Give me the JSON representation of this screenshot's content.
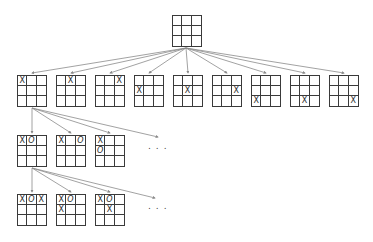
{
  "diagram": {
    "colors": {
      "line": "#3a3a3a",
      "edge": "#8a8a8a",
      "mark": "#2a2a2a"
    },
    "ellipsis": "...",
    "levels": [
      {
        "level": 0,
        "boards": [
          {
            "id": "root",
            "x": 172,
            "y": 15,
            "cells": [
              "",
              "",
              "",
              "",
              "",
              "",
              "",
              "",
              ""
            ]
          }
        ]
      },
      {
        "level": 1,
        "boards": [
          {
            "id": "b1-1",
            "x": 17,
            "y": 75,
            "cells": [
              "X",
              "",
              "",
              "",
              "",
              "",
              "",
              "",
              ""
            ]
          },
          {
            "id": "b1-2",
            "x": 56,
            "y": 75,
            "cells": [
              "",
              "X",
              "",
              "",
              "",
              "",
              "",
              "",
              ""
            ]
          },
          {
            "id": "b1-3",
            "x": 95,
            "y": 75,
            "cells": [
              "",
              "",
              "X",
              "",
              "",
              "",
              "",
              "",
              ""
            ]
          },
          {
            "id": "b1-4",
            "x": 134,
            "y": 75,
            "cells": [
              "",
              "",
              "",
              "X",
              "",
              "",
              "",
              "",
              ""
            ]
          },
          {
            "id": "b1-5",
            "x": 173,
            "y": 75,
            "cells": [
              "",
              "",
              "",
              "",
              "X",
              "",
              "",
              "",
              ""
            ]
          },
          {
            "id": "b1-6",
            "x": 212,
            "y": 75,
            "cells": [
              "",
              "",
              "",
              "",
              "",
              "X",
              "",
              "",
              ""
            ]
          },
          {
            "id": "b1-7",
            "x": 251,
            "y": 75,
            "cells": [
              "",
              "",
              "",
              "",
              "",
              "",
              "X",
              "",
              ""
            ]
          },
          {
            "id": "b1-8",
            "x": 290,
            "y": 75,
            "cells": [
              "",
              "",
              "",
              "",
              "",
              "",
              "",
              "X",
              ""
            ]
          },
          {
            "id": "b1-9",
            "x": 329,
            "y": 75,
            "cells": [
              "",
              "",
              "",
              "",
              "",
              "",
              "",
              "",
              "X"
            ]
          }
        ]
      },
      {
        "level": 2,
        "boards": [
          {
            "id": "b2-1",
            "x": 17,
            "y": 135,
            "cells": [
              "X",
              "O",
              "",
              "",
              "",
              "",
              "",
              "",
              ""
            ]
          },
          {
            "id": "b2-2",
            "x": 56,
            "y": 135,
            "cells": [
              "X",
              "",
              "O",
              "",
              "",
              "",
              "",
              "",
              ""
            ]
          },
          {
            "id": "b2-3",
            "x": 95,
            "y": 135,
            "cells": [
              "X",
              "",
              "",
              "O",
              "",
              "",
              "",
              "",
              ""
            ]
          }
        ],
        "ellipsis_pos": {
          "x": 148,
          "y": 141
        }
      },
      {
        "level": 3,
        "boards": [
          {
            "id": "b3-1",
            "x": 17,
            "y": 194,
            "cells": [
              "X",
              "O",
              "X",
              "",
              "",
              "",
              "",
              "",
              ""
            ]
          },
          {
            "id": "b3-2",
            "x": 56,
            "y": 194,
            "cells": [
              "X",
              "O",
              "",
              "X",
              "",
              "",
              "",
              "",
              ""
            ]
          },
          {
            "id": "b3-3",
            "x": 95,
            "y": 194,
            "cells": [
              "X",
              "O",
              "",
              "",
              "X",
              "",
              "",
              "",
              ""
            ]
          }
        ],
        "ellipsis_pos": {
          "x": 148,
          "y": 201
        }
      }
    ],
    "edges": [
      {
        "from": [
          186,
          48
        ],
        "to": [
          32,
          73
        ]
      },
      {
        "from": [
          186,
          48
        ],
        "to": [
          71,
          73
        ]
      },
      {
        "from": [
          186,
          48
        ],
        "to": [
          110,
          73
        ]
      },
      {
        "from": [
          186,
          48
        ],
        "to": [
          149,
          73
        ]
      },
      {
        "from": [
          186,
          48
        ],
        "to": [
          188,
          73
        ]
      },
      {
        "from": [
          186,
          48
        ],
        "to": [
          227,
          73
        ]
      },
      {
        "from": [
          186,
          48
        ],
        "to": [
          266,
          73
        ]
      },
      {
        "from": [
          186,
          48
        ],
        "to": [
          305,
          73
        ]
      },
      {
        "from": [
          186,
          48
        ],
        "to": [
          344,
          73
        ]
      },
      {
        "from": [
          32,
          108
        ],
        "to": [
          32,
          133
        ]
      },
      {
        "from": [
          32,
          108
        ],
        "to": [
          71,
          133
        ]
      },
      {
        "from": [
          32,
          108
        ],
        "to": [
          110,
          133
        ]
      },
      {
        "from": [
          32,
          108
        ],
        "to": [
          158,
          137
        ]
      },
      {
        "from": [
          32,
          168
        ],
        "to": [
          32,
          192
        ]
      },
      {
        "from": [
          32,
          168
        ],
        "to": [
          71,
          192
        ]
      },
      {
        "from": [
          32,
          168
        ],
        "to": [
          110,
          192
        ]
      },
      {
        "from": [
          32,
          168
        ],
        "to": [
          155,
          198
        ]
      }
    ]
  }
}
